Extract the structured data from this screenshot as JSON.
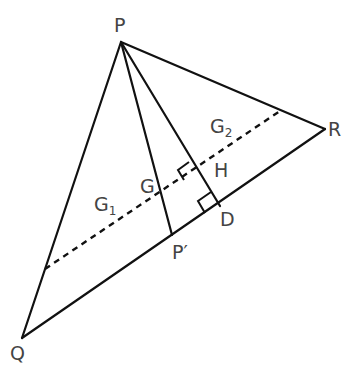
{
  "diagram": {
    "type": "geometry-triangle",
    "stroke_color": "#111111",
    "label_color": "#444444",
    "points": {
      "P": {
        "x": 121,
        "y": 42,
        "label": "P"
      },
      "Q": {
        "x": 22,
        "y": 338,
        "label": "Q"
      },
      "R": {
        "x": 325,
        "y": 129,
        "label": "R"
      },
      "P_prime": {
        "x": 172,
        "y": 235,
        "label": "P′"
      },
      "D": {
        "x": 220,
        "y": 206,
        "label": "D"
      },
      "G": {
        "x": 162,
        "y": 189,
        "label": "G"
      },
      "H": {
        "x": 193,
        "y": 168,
        "label": "H"
      }
    },
    "labels": {
      "P": "P",
      "Q": "Q",
      "R": "R",
      "P_prime": "P′",
      "D": "D",
      "G": "G",
      "H": "H",
      "G1_base": "G",
      "G1_sub": "1",
      "G2_base": "G",
      "G2_sub": "2"
    },
    "segments": [
      {
        "from": "P",
        "to": "Q",
        "style": "solid"
      },
      {
        "from": "P",
        "to": "R",
        "style": "solid"
      },
      {
        "from": "Q",
        "to": "R",
        "style": "solid"
      },
      {
        "from": "P",
        "to": "P_prime",
        "style": "solid",
        "name": "median"
      },
      {
        "from": "P",
        "to": "D",
        "style": "solid",
        "name": "altitude"
      }
    ],
    "dashed_line": {
      "x1": 45,
      "y1": 269,
      "x2": 280,
      "y2": 111
    },
    "right_angles": [
      "H",
      "D"
    ]
  }
}
